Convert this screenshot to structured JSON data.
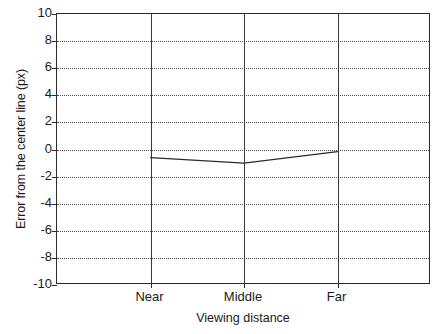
{
  "chart_data": {
    "type": "line",
    "title": "",
    "subtitle": "",
    "xlabel": "Viewing distance",
    "ylabel": "Error from the center line (px)",
    "categories": [
      "Near",
      "Middle",
      "Far"
    ],
    "values": [
      -0.6,
      -1.0,
      -0.15
    ],
    "series": [
      {
        "name": "Error from the center line",
        "values": [
          -0.6,
          -1.0,
          -0.15
        ]
      }
    ],
    "ylim": [
      -10,
      10
    ],
    "yticks": [
      10,
      8,
      6,
      4,
      2,
      0,
      -2,
      -4,
      -6,
      -8,
      -10
    ],
    "ytick_labels": [
      "10",
      "8",
      "6",
      "4",
      "2",
      "0",
      "-2",
      "-4",
      "-6",
      "-8",
      "-10"
    ],
    "xticks": [
      "Near",
      "Middle",
      "Far"
    ],
    "grid": {
      "horizontal": true,
      "vertical": true,
      "horizontal_style": "dotted",
      "vertical_style": "solid"
    },
    "legend": null,
    "legend_position": "none",
    "annotations": [],
    "colors": {
      "line": "#2b2b2b",
      "axis": "#2b2b2b",
      "grid_horizontal": "#4a4a4a",
      "grid_vertical": "#3a3a3a",
      "background": "#ffffff",
      "text": "#1a1a1a"
    }
  }
}
